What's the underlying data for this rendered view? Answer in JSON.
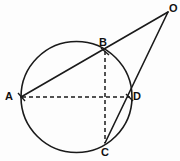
{
  "figure": {
    "background_color": "#fdfdfd",
    "stroke_color": "#1a1a1a",
    "label_color": "#111111"
  },
  "labels": {
    "A": "A",
    "B": "B",
    "C": "C",
    "D": "D",
    "O": "O"
  },
  "geometry": {
    "circle": {
      "cx": 76.5,
      "cy": 97,
      "r": 55.5,
      "style": "solid"
    },
    "points": [
      {
        "name": "A",
        "x": 21,
        "y": 97,
        "label_x": 5,
        "label_y": 91
      },
      {
        "name": "B",
        "x": 105,
        "y": 51,
        "label_x": 99,
        "label_y": 37
      },
      {
        "name": "C",
        "x": 105,
        "y": 143,
        "label_x": 101,
        "label_y": 148
      },
      {
        "name": "D",
        "x": 130,
        "y": 97,
        "label_x": 133,
        "label_y": 91
      },
      {
        "name": "O",
        "x": 168,
        "y": 12,
        "label_x": 169,
        "label_y": 4
      }
    ],
    "segments": [
      {
        "name": "A-B-O",
        "from": "A",
        "to": "O",
        "style": "solid"
      },
      {
        "name": "C-D-O",
        "from": "C",
        "to": "O",
        "style": "solid"
      },
      {
        "name": "A-D",
        "from": "A",
        "to": "D",
        "style": "dashed"
      },
      {
        "name": "B-C",
        "from": "B",
        "to": "C",
        "style": "dashed"
      }
    ]
  }
}
